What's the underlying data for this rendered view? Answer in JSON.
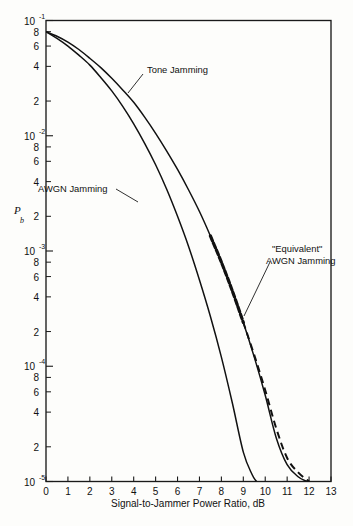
{
  "figure": {
    "kind": "semilog-chart",
    "background_color": "#fdfdfb",
    "ink_color": "#111111"
  },
  "axes": {
    "x_title": "Signal-to-Jammer Power Ratio, dB",
    "y_title": "P",
    "y_title_sub": "b",
    "x_tick_labels": [
      "0",
      "1",
      "2",
      "3",
      "4",
      "5",
      "6",
      "7",
      "8",
      "9",
      "10",
      "11",
      "12",
      "13"
    ],
    "y_decade_labels": [
      {
        "mantissa": "10",
        "exponent": "-1"
      },
      {
        "mantissa": "10",
        "exponent": "-2"
      },
      {
        "mantissa": "10",
        "exponent": "-3"
      },
      {
        "mantissa": "10",
        "exponent": "-4"
      },
      {
        "mantissa": "10",
        "exponent": "-5"
      }
    ],
    "y_minor_labels": [
      "8",
      "6",
      "4",
      "2"
    ]
  },
  "annotations": [
    {
      "id": "tone-jamming",
      "text": "Tone Jamming"
    },
    {
      "id": "awgn-jamming",
      "text": "AWGN Jamming"
    },
    {
      "id": "equivalent-awgn-line1",
      "text": "\"Equivalent\""
    },
    {
      "id": "equivalent-awgn-line2",
      "text": "AWGN Jamming"
    }
  ],
  "chart_data": {
    "type": "line",
    "title": "",
    "subtitle": "",
    "xlabel": "Signal-to-Jammer Power Ratio, dB",
    "ylabel": "Pb",
    "xlim": [
      0,
      13
    ],
    "ylim": [
      1e-05,
      0.1
    ],
    "yscale": "log",
    "grid": false,
    "legend_position": "inline-annotations",
    "xticks": [
      0,
      1,
      2,
      3,
      4,
      5,
      6,
      7,
      8,
      9,
      10,
      11,
      12,
      13
    ],
    "yticks": [
      0.1,
      0.08,
      0.06,
      0.04,
      0.02,
      0.01,
      0.008,
      0.006,
      0.004,
      0.002,
      0.001,
      0.0008,
      0.0006,
      0.0004,
      0.0002,
      0.0001,
      8e-05,
      6e-05,
      4e-05,
      2e-05,
      1e-05
    ],
    "series": [
      {
        "name": "Tone Jamming",
        "style": "solid",
        "x": [
          0,
          0.5,
          1,
          1.5,
          2,
          2.5,
          3,
          3.5,
          4,
          4.5,
          5,
          5.5,
          6,
          6.5,
          7,
          7.5,
          8,
          8.5,
          9,
          9.5,
          10,
          10.5,
          11,
          11.5,
          11.9
        ],
        "y": [
          0.08,
          0.073,
          0.065,
          0.056,
          0.047,
          0.039,
          0.0315,
          0.025,
          0.0195,
          0.0145,
          0.0105,
          0.0074,
          0.0051,
          0.0034,
          0.0022,
          0.00135,
          0.0008,
          0.00045,
          0.00024,
          0.00012,
          5.6e-05,
          2.4e-05,
          1.4e-05,
          1.1e-05,
          1e-05
        ]
      },
      {
        "name": "AWGN Jamming",
        "style": "solid",
        "x": [
          0,
          0.5,
          1,
          1.5,
          2,
          2.5,
          3,
          3.5,
          4,
          4.5,
          5,
          5.5,
          6,
          6.5,
          7,
          7.5,
          8,
          8.5,
          9,
          9.4,
          9.6
        ],
        "y": [
          0.08,
          0.07,
          0.06,
          0.05,
          0.041,
          0.032,
          0.0245,
          0.018,
          0.0127,
          0.0086,
          0.0056,
          0.00345,
          0.002,
          0.0011,
          0.00056,
          0.00027,
          0.00012,
          4.8e-05,
          1.8e-05,
          1.15e-05,
          1e-05
        ]
      },
      {
        "name": "\"Equivalent\" AWGN Jamming",
        "style": "dashed",
        "note": "coincides with Tone Jamming above Pb~3e-4, then lies slightly to the right",
        "x": [
          7.5,
          8,
          8.5,
          9,
          9.5,
          10,
          10.5,
          11,
          11.5,
          12.0
        ],
        "y": [
          0.00135,
          0.0008,
          0.00045,
          0.00024,
          0.000125,
          6.2e-05,
          2.9e-05,
          1.6e-05,
          1.2e-05,
          1e-05
        ]
      }
    ]
  }
}
